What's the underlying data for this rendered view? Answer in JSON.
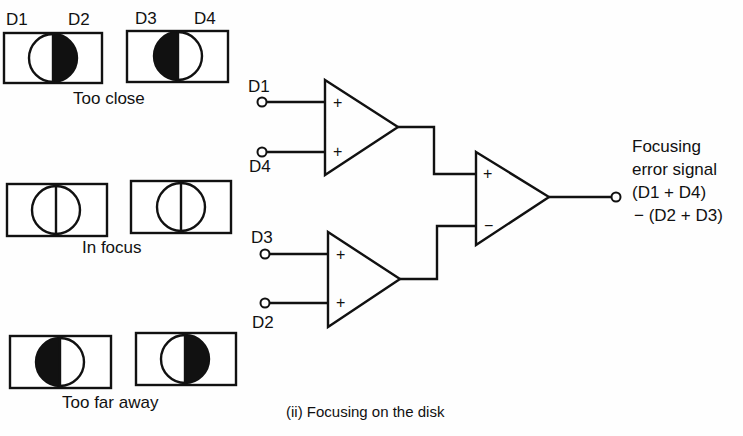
{
  "detector_panels": {
    "too_close": {
      "caption": "Too close",
      "labels": {
        "d1": "D1",
        "d2": "D2",
        "d3": "D3",
        "d4": "D4"
      },
      "left_detector_dark_side": "right",
      "right_detector_dark_side": "left"
    },
    "in_focus": {
      "caption": "In focus",
      "left_detector_dark_side": "none",
      "right_detector_dark_side": "none"
    },
    "too_far": {
      "caption": "Too far away",
      "left_detector_dark_side": "left",
      "right_detector_dark_side": "right"
    }
  },
  "circuit": {
    "amp_top": {
      "inputs": [
        {
          "label": "D1",
          "sign": "+"
        },
        {
          "label": "D4",
          "sign": "+"
        }
      ]
    },
    "amp_bottom": {
      "inputs": [
        {
          "label": "D3",
          "sign": "+"
        },
        {
          "label": "D2",
          "sign": "+"
        }
      ]
    },
    "amp_diff": {
      "inputs": [
        {
          "sign": "+"
        },
        {
          "sign": "−"
        }
      ]
    },
    "output": {
      "line1": "Focusing",
      "line2": "error signal",
      "line3": "(D1 + D4)",
      "line4": "− (D2 + D3)"
    }
  },
  "caption": "(ii) Focusing on the disk"
}
